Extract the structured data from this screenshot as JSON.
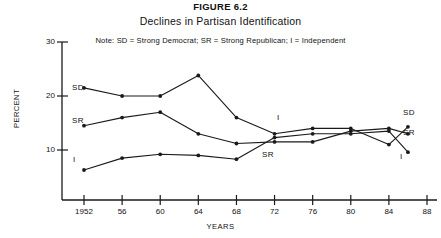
{
  "figure": {
    "number": "FIGURE 6.2",
    "title": "Declines in Partisan Identification",
    "note": "Note: SD = Strong Democrat; SR = Strong Republican; I = Independent"
  },
  "axes": {
    "ylabel": "PERCENT",
    "xlabel": "YEARS",
    "yticks": [
      "10",
      "20",
      "30"
    ],
    "xticks": [
      "1952",
      "56",
      "60",
      "64",
      "68",
      "72",
      "76",
      "80",
      "84",
      "88"
    ]
  },
  "labels": {
    "sd_left": "SD",
    "sr_left": "SR",
    "i_left": "I",
    "i_mid": "I",
    "sr_mid": "SR",
    "sd_right": "SD",
    "sr_right": "SR",
    "i_right": "I"
  },
  "colors": {
    "line": "#1a1a1a",
    "axis": "#1a1a1a",
    "background": "#ffffff"
  },
  "chart_data": {
    "type": "line",
    "title": "Declines in Partisan Identification",
    "subtitle": "FIGURE 6.2",
    "annotation": "Note: SD = Strong Democrat; SR = Strong Republican; I = Independent",
    "xlabel": "YEARS",
    "ylabel": "PERCENT",
    "xlim": [
      1951,
      1988
    ],
    "ylim": [
      0,
      30
    ],
    "yticks": [
      10,
      20,
      30
    ],
    "xticks": [
      1952,
      1956,
      1960,
      1964,
      1968,
      1972,
      1976,
      1980,
      1984,
      1988
    ],
    "grid": false,
    "legend": "inline-endpoint-labels",
    "x": [
      1952,
      1956,
      1960,
      1964,
      1968,
      1972,
      1976,
      1980,
      1984,
      1986
    ],
    "series": [
      {
        "name": "SD",
        "full_name": "Strong Democrat",
        "values": [
          21.5,
          20.0,
          20.0,
          23.8,
          16.0,
          13.0,
          14.0,
          14.0,
          11.0,
          14.3
        ]
      },
      {
        "name": "SR",
        "full_name": "Strong Republican",
        "values": [
          14.5,
          16.0,
          17.0,
          13.0,
          11.2,
          11.5,
          11.5,
          13.5,
          14.0,
          13.0
        ]
      },
      {
        "name": "I",
        "full_name": "Independent",
        "values": [
          6.3,
          8.5,
          9.2,
          9.0,
          8.3,
          12.3,
          13.0,
          13.0,
          13.5,
          9.6
        ]
      }
    ]
  }
}
